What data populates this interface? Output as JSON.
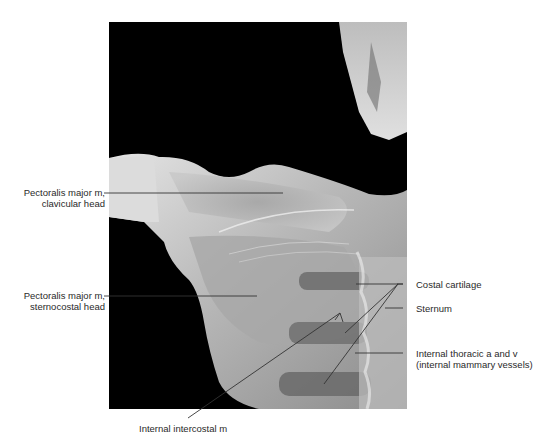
{
  "figure": {
    "labels": {
      "pectoralis_clavicular_line1": "Pectoralis major m,",
      "pectoralis_clavicular_line2": "clavicular head",
      "pectoralis_sternocostal_line1": "Pectoralis major m,",
      "pectoralis_sternocostal_line2": "sternocostal head",
      "costal_cartilage": "Costal cartilage",
      "sternum": "Sternum",
      "internal_thoracic_line1": "Internal thoracic a and v",
      "internal_thoracic_line2": "(internal mammary vessels)",
      "internal_intercostal": "Internal intercostal m"
    },
    "colors": {
      "background": "#ffffff",
      "image_dark": "#000000",
      "tissue_light": "#d9d9d9",
      "tissue_mid": "#9a9a9a",
      "leader_line": "#333333"
    }
  }
}
